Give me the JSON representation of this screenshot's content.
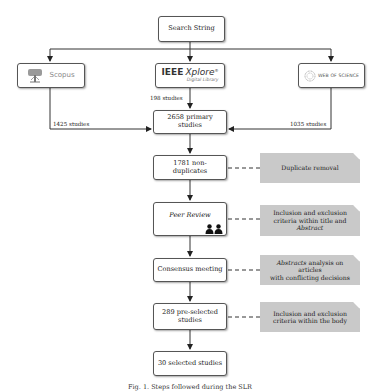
{
  "diagram": {
    "root": {
      "label": "Search String"
    },
    "sources": [
      {
        "id": "scopus",
        "label": "Scopus",
        "icon": "scopus-tree-logo-icon",
        "count_label": "1425 studies"
      },
      {
        "id": "ieee",
        "label_main": "IEEE",
        "label_italic": "Xplore",
        "label_reg": "®",
        "label_sub": "Digital Library",
        "icon": "ieee-xplore-logo-icon",
        "count_label": "198 studies"
      },
      {
        "id": "wos",
        "label": "WEB OF SCIENCE",
        "icon": "web-of-science-globe-logo-icon",
        "count_label": "1035 studies"
      }
    ],
    "steps": [
      {
        "label_line1": "2658 primary",
        "label_line2": "studies"
      },
      {
        "label": "1781 non-duplicates"
      },
      {
        "label": "Peer Review",
        "icon": "people-pair-icon"
      },
      {
        "label": "Consensus meeting"
      },
      {
        "label_line1": "289 pre-selected",
        "label_line2": "studies"
      },
      {
        "label": "30 selected studies"
      }
    ],
    "notes": [
      {
        "text": "Duplicate removal"
      },
      {
        "text_line1": "Inclusion and exclusion",
        "text_line2": "criteria within title and",
        "text_line3_italic": "Abstract"
      },
      {
        "text_italic": "Abstracts",
        "text_rest": " analysis on articles",
        "text_line2": "with conflicting decisions"
      },
      {
        "text_line1": "Inclusion and exclusion",
        "text_line2": "criteria within the body"
      }
    ],
    "caption": "Fig. 1. Steps followed during the SLR"
  },
  "colors": {
    "note_fill": "#c9c9c9",
    "box_border": "#555555",
    "line": "#333333"
  }
}
